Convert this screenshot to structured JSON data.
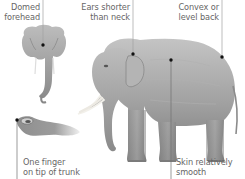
{
  "diagram": {
    "labels": [
      {
        "id": "domed-forehead",
        "lines": [
          "Domed",
          "forehead"
        ]
      },
      {
        "id": "ears-shorter",
        "lines": [
          "Ears shorter",
          "than neck"
        ]
      },
      {
        "id": "convex-back",
        "lines": [
          "Convex or",
          "level back"
        ]
      },
      {
        "id": "one-finger",
        "lines": [
          "One finger",
          "on tip of trunk"
        ]
      },
      {
        "id": "skin-smooth",
        "lines": [
          "Skin relatively",
          "smooth"
        ]
      }
    ],
    "colors": {
      "background": "#ffffff",
      "text": "#666666",
      "leader_line": "#9a9a9a",
      "dot": "#111111",
      "elephant_light": "#c9c9c9",
      "elephant_mid": "#9d9d9d",
      "elephant_dark": "#6e6e6e",
      "tusk": "#ece9e2"
    }
  }
}
